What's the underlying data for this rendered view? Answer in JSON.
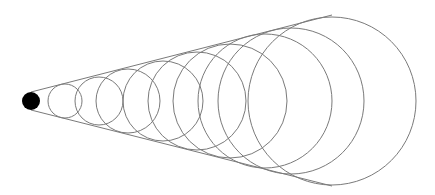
{
  "diagram": {
    "kind": "cone-inscribed-circles",
    "description": "Sequence of circles growing in size, inscribed between two tangent lines forming a cone that widens to the right, starting from a filled black dot",
    "canvas": {
      "width": 435,
      "height": 195,
      "background": "#ffffff"
    },
    "stroke_color": "#7a7a7a",
    "stroke_width": 1,
    "apex_dot": {
      "cx": 31,
      "cy": 101,
      "r": 9,
      "fill": "#000000"
    },
    "tangent_lines": [
      {
        "name": "upper-tangent-line",
        "x1": 31,
        "y1": 92,
        "x2": 332,
        "y2": 15
      },
      {
        "name": "lower-tangent-line",
        "x1": 31,
        "y1": 110,
        "x2": 332,
        "y2": 186
      }
    ],
    "circles": [
      {
        "cx": 65,
        "cy": 101,
        "r": 17
      },
      {
        "cx": 99,
        "cy": 101,
        "r": 24
      },
      {
        "cx": 128,
        "cy": 101,
        "r": 32
      },
      {
        "cx": 163,
        "cy": 101,
        "r": 40
      },
      {
        "cx": 197,
        "cy": 101,
        "r": 49
      },
      {
        "cx": 230,
        "cy": 101,
        "r": 57
      },
      {
        "cx": 265,
        "cy": 101,
        "r": 67
      },
      {
        "cx": 291,
        "cy": 101,
        "r": 73
      },
      {
        "cx": 332,
        "cy": 101,
        "r": 84
      }
    ]
  }
}
